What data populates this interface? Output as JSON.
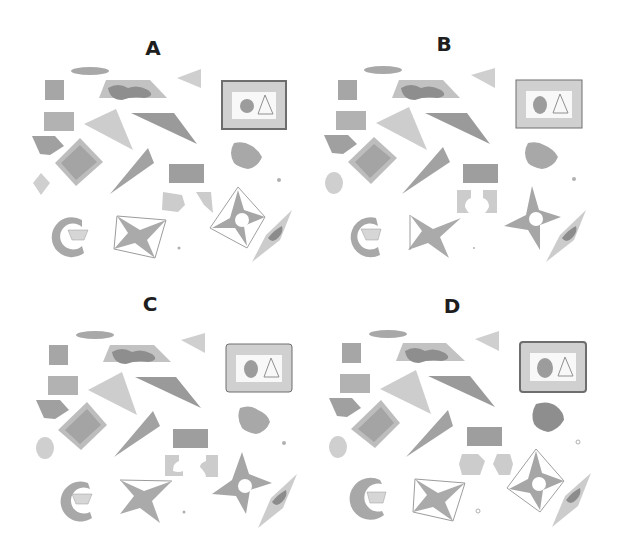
{
  "panels": [
    {
      "id": "A",
      "label": "A",
      "x": 0,
      "y": 0
    },
    {
      "id": "B",
      "label": "B",
      "x": 300,
      "y": 0
    },
    {
      "id": "C",
      "label": "C",
      "x": 0,
      "y": 280
    },
    {
      "id": "D",
      "label": "D",
      "x": 300,
      "y": 280
    }
  ],
  "colors": {
    "light": "#d4d4d4",
    "mid": "#b8b8b8",
    "dark": "#9a9a9a",
    "darker": "#7e7e7e",
    "outline": "#8a8a8a",
    "frame": "#6e6e6e",
    "label": "#1e1e1e"
  }
}
